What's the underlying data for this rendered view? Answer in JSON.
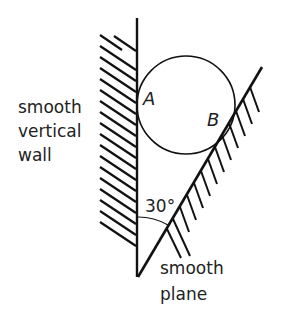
{
  "diagram": {
    "title": "",
    "labels": {
      "wall": [
        "smooth",
        "vertical",
        "wall"
      ],
      "plane": [
        "smooth",
        "plane"
      ],
      "point_a": "A",
      "point_b": "B",
      "angle": "30°"
    },
    "geometry": {
      "wall_x": 137,
      "wall_top_y": 18,
      "vertex": [
        138,
        277
      ],
      "plane_end": [
        262,
        67
      ],
      "angle_between_wall_and_plane_deg": 30,
      "sphere_center": [
        186,
        105
      ],
      "sphere_radius": 49
    },
    "colors": {
      "ink": "#111111",
      "text": "#222222",
      "background": "#ffffff"
    }
  }
}
